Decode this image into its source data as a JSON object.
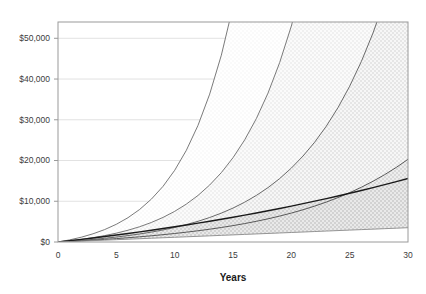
{
  "chart_data": {
    "type": "area",
    "title": "",
    "subtitle": "",
    "xlabel": "Years",
    "ylabel": "",
    "x": [
      0,
      1,
      2,
      3,
      4,
      5,
      6,
      7,
      8,
      9,
      10,
      11,
      12,
      13,
      14,
      15,
      16,
      17,
      18,
      19,
      20,
      21,
      22,
      23,
      24,
      25,
      26,
      27,
      28,
      29,
      30
    ],
    "xlim": [
      0,
      30
    ],
    "ylim": [
      0,
      54000
    ],
    "xticks": [
      0,
      5,
      10,
      15,
      20,
      25,
      30
    ],
    "xtick_labels": [
      "0",
      "5",
      "10",
      "15",
      "20",
      "25",
      "30"
    ],
    "yticks": [
      0,
      10000,
      20000,
      30000,
      40000,
      50000
    ],
    "ytick_labels": [
      "$0",
      "$10,000",
      "$20,000",
      "$30,000",
      "$40,000",
      "$50,000"
    ],
    "grid": true,
    "grid_axis": "y",
    "legend": "none",
    "series": [
      {
        "name": "Band 5 (highest growth)",
        "fill": "#fbfbfb",
        "line": "#6b6b6b",
        "values": [
          0,
          520,
          1180,
          2010,
          3050,
          4350,
          5970,
          7990,
          10510,
          13660,
          17590,
          22500,
          28630,
          36290,
          45850,
          57800,
          72700,
          91300,
          114500,
          143500,
          179500,
          224000,
          279500,
          348500,
          434000,
          540000,
          672000,
          836000,
          1039000,
          1291000,
          1604000
        ]
      },
      {
        "name": "Band 4",
        "fill": "#f5f5f5",
        "line": "#6b6b6b",
        "values": [
          0,
          300,
          650,
          1070,
          1570,
          2170,
          2890,
          3750,
          4790,
          6030,
          7520,
          9300,
          11430,
          13980,
          17030,
          20690,
          25060,
          30290,
          36550,
          44040,
          53000,
          63740,
          76590,
          91970,
          110380,
          132410,
          158780,
          190340,
          228120,
          273340,
          327500
        ]
      },
      {
        "name": "Band 3",
        "fill": "#ececec",
        "line": "#5a5a5a",
        "values": [
          0,
          190,
          400,
          640,
          910,
          1220,
          1570,
          1970,
          2430,
          2960,
          3570,
          4270,
          5080,
          6010,
          7090,
          8330,
          9770,
          11430,
          13350,
          15570,
          18130,
          21090,
          24500,
          28440,
          32990,
          38240,
          44300,
          51300,
          59380,
          68710,
          79500
        ]
      },
      {
        "name": "Band 2",
        "fill": "#d9d9d9",
        "line": "#4a4a4a",
        "values": [
          0,
          140,
          295,
          460,
          640,
          835,
          1045,
          1275,
          1525,
          1795,
          2090,
          2410,
          2760,
          3140,
          3560,
          4020,
          4525,
          5080,
          5690,
          6360,
          7100,
          7915,
          8815,
          9805,
          10900,
          12105,
          13440,
          14910,
          16530,
          18320,
          20300
        ]
      },
      {
        "name": "Band 1 (accumulated principal)",
        "fill": "#d0d0d0",
        "line": "#1a1a1a",
        "values": [
          0,
          320,
          650,
          990,
          1345,
          1710,
          2090,
          2480,
          2885,
          3300,
          3730,
          4175,
          4630,
          5100,
          5585,
          6085,
          6600,
          7130,
          7675,
          8235,
          8815,
          9410,
          10020,
          10650,
          11295,
          11960,
          12645,
          13350,
          14075,
          14820,
          15590
        ]
      },
      {
        "name": "Baseline (contributions only)",
        "fill": "#ffffff",
        "line": "#8a8a8a",
        "values": [
          0,
          110,
          225,
          340,
          455,
          570,
          690,
          805,
          925,
          1040,
          1160,
          1275,
          1395,
          1510,
          1630,
          1745,
          1865,
          1980,
          2100,
          2215,
          2335,
          2450,
          2570,
          2685,
          2805,
          2920,
          3040,
          3155,
          3275,
          3390,
          3510
        ]
      }
    ],
    "visible_endpoints": {
      "band1_at_30": 10800,
      "band2_at_30": 44000,
      "band3_exits_top_at_year": 22.7,
      "band4_exits_top_at_year": 13.0
    },
    "colors": {
      "plot_border": "#9a9a9a",
      "gridline": "#e2e2e2",
      "axis_text": "#3c3c3c",
      "title_text": "#1a1a1a",
      "background": "#ffffff"
    }
  }
}
